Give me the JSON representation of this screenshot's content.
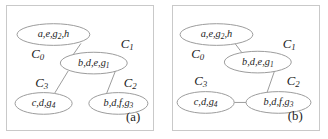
{
  "figure": {
    "width": 328,
    "height": 139,
    "background": "#ffffff",
    "edge_color": "#9a9a9a",
    "node_stroke_color": "#9a9a9a",
    "node_fill_color": "#ffffff",
    "text_color": "#1c1c1c",
    "panel_border_color": "#c9c9c9"
  },
  "panels": [
    {
      "id": "a",
      "caption": "(a)",
      "topology": "star",
      "nodes": [
        {
          "id": "C0",
          "cluster_label": "C",
          "cluster_subscript": "0",
          "members": "a,e,g",
          "members_subscript": "2",
          "members_tail": ",h",
          "full_text": "a,e,g2,h",
          "cx": 47,
          "cy": 29,
          "rx": 37,
          "ry": 11,
          "cluster_x": 31,
          "cluster_y": 50
        },
        {
          "id": "C1",
          "cluster_label": "C",
          "cluster_subscript": "1",
          "members": "b,d,e,g",
          "members_subscript": "1",
          "members_tail": "",
          "full_text": "b,d,e,g1",
          "cx": 88,
          "cy": 58,
          "rx": 34,
          "ry": 11,
          "cluster_x": 122,
          "cluster_y": 40
        },
        {
          "id": "C3",
          "cluster_label": "C",
          "cluster_subscript": "3",
          "members": "c,d,g",
          "members_subscript": "4",
          "members_tail": "",
          "full_text": "c,d,g4",
          "cx": 37,
          "cy": 99,
          "rx": 29,
          "ry": 11,
          "cluster_x": 35,
          "cluster_y": 79
        },
        {
          "id": "C2",
          "cluster_label": "C",
          "cluster_subscript": "2",
          "members": "b,d,f,g",
          "members_subscript": "3",
          "members_tail": "",
          "full_text": "b,d,f,g3",
          "cx": 113,
          "cy": 99,
          "rx": 30,
          "ry": 11,
          "cluster_x": 125,
          "cluster_y": 79
        }
      ],
      "edges": [
        {
          "from": "C1",
          "to": "C0",
          "x1": 66,
          "y1": 51,
          "x2": 75,
          "y2": 38
        },
        {
          "from": "C1",
          "to": "C3",
          "x1": 62,
          "y1": 66,
          "x2": 48,
          "y2": 89
        },
        {
          "from": "C1",
          "to": "C2",
          "x1": 110,
          "y1": 66,
          "x2": 101,
          "y2": 89
        }
      ],
      "caption_x": 128,
      "caption_y": 114
    },
    {
      "id": "b",
      "caption": "(b)",
      "topology": "chain",
      "nodes": [
        {
          "id": "C0",
          "cluster_label": "C",
          "cluster_subscript": "0",
          "members": "a,e,g",
          "members_subscript": "2",
          "members_tail": ",h",
          "full_text": "a,e,g2,h",
          "cx": 44,
          "cy": 29,
          "rx": 37,
          "ry": 11,
          "cluster_x": 25,
          "cluster_y": 50
        },
        {
          "id": "C1",
          "cluster_label": "C",
          "cluster_subscript": "1",
          "members": "b,d,e,g",
          "members_subscript": "1",
          "members_tail": "",
          "full_text": "b,d,e,g1",
          "cx": 86,
          "cy": 57,
          "rx": 34,
          "ry": 11,
          "cluster_x": 118,
          "cluster_y": 40
        },
        {
          "id": "C3",
          "cluster_label": "C",
          "cluster_subscript": "3",
          "members": "c,d,g",
          "members_subscript": "4",
          "members_tail": "",
          "full_text": "c,d,g4",
          "cx": 33,
          "cy": 98,
          "rx": 29,
          "ry": 11,
          "cluster_x": 28,
          "cluster_y": 77
        },
        {
          "id": "C2",
          "cluster_label": "C",
          "cluster_subscript": "2",
          "members": "b,d,f,g",
          "members_subscript": "3",
          "members_tail": "",
          "full_text": "b,d,f,g3",
          "cx": 107,
          "cy": 98,
          "rx": 33,
          "ry": 11,
          "cluster_x": 122,
          "cluster_y": 77
        }
      ],
      "edges": [
        {
          "from": "C0",
          "to": "C1",
          "x1": 62,
          "y1": 37,
          "x2": 71,
          "y2": 49
        },
        {
          "from": "C1",
          "to": "C2",
          "x1": 103,
          "y1": 66,
          "x2": 95,
          "y2": 89
        },
        {
          "from": "C2",
          "to": "C3",
          "x1": 62,
          "y1": 98,
          "x2": 74,
          "y2": 98
        }
      ],
      "caption_x": 124,
      "caption_y": 113
    }
  ]
}
